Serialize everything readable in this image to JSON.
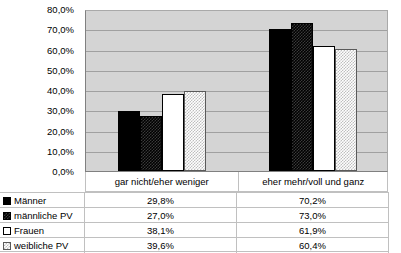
{
  "chart_data": {
    "type": "bar",
    "title": "",
    "xlabel": "",
    "ylabel": "",
    "categories": [
      "gar nicht/eher weniger",
      "eher mehr/voll und ganz"
    ],
    "series": [
      {
        "name": "Männer",
        "swatch": "solid-black",
        "values": [
          29.8,
          70.2
        ],
        "labels": [
          "29,8%",
          "70,2%"
        ]
      },
      {
        "name": "männliche PV",
        "swatch": "dark-checker",
        "values": [
          27.0,
          73.0
        ],
        "labels": [
          "27,0%",
          "73,0%"
        ]
      },
      {
        "name": "Frauen",
        "swatch": "white",
        "values": [
          38.1,
          61.9
        ],
        "labels": [
          "38,1%",
          "61,9%"
        ]
      },
      {
        "name": "weibliche PV",
        "swatch": "light-checker",
        "values": [
          39.6,
          60.4
        ],
        "labels": [
          "39,6%",
          "60,4%"
        ]
      }
    ],
    "ylim": [
      0,
      80
    ],
    "ytick_values": [
      0,
      10,
      20,
      30,
      40,
      50,
      60,
      70,
      80
    ],
    "ytick_labels": [
      "0,0%",
      "10,0%",
      "20,0%",
      "30,0%",
      "40,0%",
      "50,0%",
      "60,0%",
      "70,0%",
      "80,0%"
    ],
    "grid": true,
    "legend_position": "bottom-table",
    "plot_background": "#d4d4d4",
    "gridline_color": "#a0a0a0",
    "axis_color": "#808080"
  },
  "table": {
    "rows": [
      {
        "label": "Männer",
        "v1": "29,8%",
        "v2": "70,2%"
      },
      {
        "label": "männliche PV",
        "v1": "27,0%",
        "v2": "73,0%"
      },
      {
        "label": "Frauen",
        "v1": "38,1%",
        "v2": "61,9%"
      },
      {
        "label": "weibliche PV",
        "v1": "39,6%",
        "v2": "60,4%"
      }
    ]
  }
}
